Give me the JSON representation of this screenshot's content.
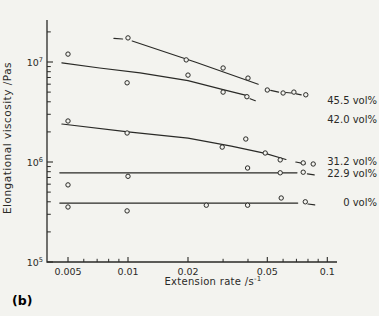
{
  "figure": {
    "panel_label": "(b)",
    "background": "#f3f3ef",
    "ink": "#2a2a27"
  },
  "chart_data": {
    "type": "scatter",
    "title": "",
    "xlabel": "Extension rate /s⁻¹",
    "ylabel": "Elongational viscosity /Pas",
    "x_scale": "log",
    "y_scale": "log",
    "xlim": [
      0.0039,
      0.112
    ],
    "ylim": [
      100000,
      26000000
    ],
    "grid": false,
    "legend_position": "right-inline",
    "x_ticks": {
      "major_values": [
        0.005,
        0.01,
        0.02,
        0.05,
        0.1
      ],
      "major_labels": [
        "0.005",
        "0.01",
        "0.02",
        "0.05",
        "0.1"
      ]
    },
    "y_ticks": {
      "major_values": [
        100000,
        1000000,
        10000000
      ],
      "major_labels": [
        "10⁵",
        "10⁶",
        "10⁷"
      ]
    },
    "series": [
      {
        "id": "45-5-vol",
        "name": "45.5 vol%",
        "label_at": 4170000,
        "points": [
          [
            0.01,
            17400000
          ],
          [
            0.0196,
            10500000
          ],
          [
            0.03,
            8700000
          ],
          [
            0.04,
            6900000
          ],
          [
            0.05,
            5250000
          ],
          [
            0.06,
            4900000
          ],
          [
            0.068,
            5000000
          ],
          [
            0.078,
            4700000
          ]
        ],
        "line_segments": [
          [
            [
              0.0085,
              17200000
            ],
            [
              0.0094,
              17000000
            ]
          ],
          [
            [
              0.0105,
              16200000
            ],
            [
              0.0217,
              10000000
            ],
            [
              0.045,
              6000000
            ]
          ],
          [
            [
              0.052,
              5200000
            ],
            [
              0.057,
              5000000
            ]
          ],
          [
            [
              0.062,
              4950000
            ],
            [
              0.066,
              4900000
            ]
          ],
          [
            [
              0.07,
              4800000
            ],
            [
              0.074,
              4700000
            ]
          ]
        ]
      },
      {
        "id": "42-0-vol",
        "name": "42.0 vol%",
        "label_at": 2690000,
        "points": [
          [
            0.005,
            12000000
          ],
          [
            0.0099,
            6200000
          ],
          [
            0.02,
            7400000
          ],
          [
            0.03,
            5000000
          ],
          [
            0.0395,
            4500000
          ]
        ],
        "line_segments": [
          [
            [
              0.00466,
              9800000
            ],
            [
              0.0072,
              8700000
            ],
            [
              0.0115,
              7800000
            ],
            [
              0.02,
              6500000
            ],
            [
              0.03,
              5300000
            ],
            [
              0.0397,
              4600000
            ]
          ],
          [
            [
              0.041,
              4300000
            ],
            [
              0.0435,
              4100000
            ]
          ]
        ]
      },
      {
        "id": "31-2-vol",
        "name": "31.2 vol%",
        "label_at": 1020000,
        "points": [
          [
            0.005,
            2570000
          ],
          [
            0.0099,
            1950000
          ],
          [
            0.0297,
            1410000
          ],
          [
            0.039,
            1700000
          ],
          [
            0.0488,
            1230000
          ],
          [
            0.058,
            1050000
          ],
          [
            0.0757,
            980000
          ],
          [
            0.085,
            955000
          ]
        ],
        "line_segments": [
          [
            [
              0.00466,
              2400000
            ],
            [
              0.01,
              2000000
            ],
            [
              0.02,
              1730000
            ],
            [
              0.033,
              1440000
            ],
            [
              0.0488,
              1220000
            ],
            [
              0.062,
              1060000
            ]
          ],
          [
            [
              0.0695,
              1000000
            ],
            [
              0.0775,
              960000
            ]
          ]
        ]
      },
      {
        "id": "22-9-vol",
        "name": "22.9 vol%",
        "label_at": 776000,
        "points": [
          [
            0.005,
            590000
          ],
          [
            0.01,
            720000
          ],
          [
            0.0398,
            870000
          ],
          [
            0.058,
            780000
          ],
          [
            0.0757,
            790000
          ]
        ],
        "line_segments": [
          [
            [
              0.00455,
              780000
            ],
            [
              0.0705,
              780000
            ]
          ],
          [
            [
              0.0795,
              760000
            ],
            [
              0.086,
              745000
            ]
          ]
        ]
      },
      {
        "id": "0-vol",
        "name": "0 vol%",
        "label_at": 398000,
        "points": [
          [
            0.005,
            355000
          ],
          [
            0.0099,
            324000
          ],
          [
            0.0247,
            370000
          ],
          [
            0.0398,
            370000
          ],
          [
            0.0587,
            437000
          ],
          [
            0.0776,
            400000
          ]
        ],
        "line_segments": [
          [
            [
              0.00455,
              388000
            ],
            [
              0.071,
              388000
            ]
          ],
          [
            [
              0.08,
              380000
            ],
            [
              0.0865,
              372000
            ]
          ]
        ]
      }
    ]
  }
}
